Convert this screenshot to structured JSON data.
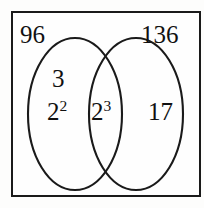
{
  "diagram": {
    "type": "venn",
    "title_left": "96",
    "title_right": "136",
    "left_only": {
      "items": [
        {
          "base": "3",
          "exponent": ""
        },
        {
          "base": "2",
          "exponent": "2"
        }
      ]
    },
    "intersection": {
      "items": [
        {
          "base": "2",
          "exponent": "3"
        }
      ]
    },
    "right_only": {
      "items": [
        {
          "base": "17",
          "exponent": ""
        }
      ]
    },
    "labels": {
      "left_title": "96",
      "right_title": "136",
      "left_item_1_base": "3",
      "left_item_1_exp": "",
      "left_item_2_base": "2",
      "left_item_2_exp": "2",
      "center_item_base": "2",
      "center_item_exp": "3",
      "right_item_base": "17",
      "right_item_exp": ""
    },
    "colors": {
      "stroke": "#1a1a1a",
      "background": "#fefefe",
      "text": "#111111"
    }
  }
}
